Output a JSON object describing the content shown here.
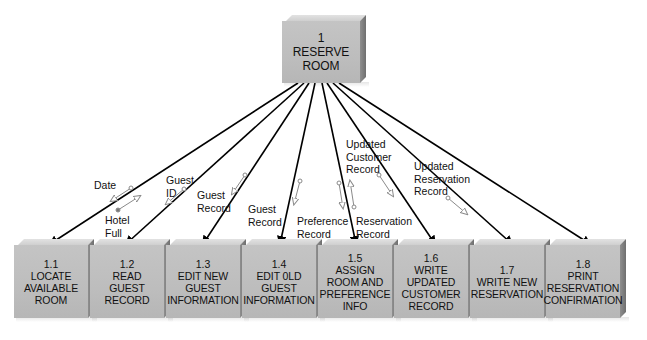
{
  "diagram": {
    "type": "structure chart",
    "root": {
      "id": "1",
      "number": "1",
      "name": "RESERVE\nROOM"
    },
    "children": [
      {
        "id": "1.1",
        "number": "1.1",
        "name": "LOCATE\nAVAILABLE\nROOM"
      },
      {
        "id": "1.2",
        "number": "1.2",
        "name": "READ\nGUEST\nRECORD"
      },
      {
        "id": "1.3",
        "number": "1.3",
        "name": "EDIT NEW\nGUEST\nINFORMATION"
      },
      {
        "id": "1.4",
        "number": "1.4",
        "name": "EDIT 0LD\nGUEST\nINFORMATION"
      },
      {
        "id": "1.5",
        "number": "1.5",
        "name": "ASSIGN\nROOM AND\nPREFERENCE\nINFO"
      },
      {
        "id": "1.6",
        "number": "1.6",
        "name": "WRITE\nUPDATED\nCUSTOMER\nRECORD"
      },
      {
        "id": "1.7",
        "number": "1.7",
        "name": "WRITE NEW\nRESERVATION"
      },
      {
        "id": "1.8",
        "number": "1.8",
        "name": "PRINT\nRESERVATION\nCONFIRMATION"
      }
    ],
    "couples": [
      {
        "label": "Date",
        "to": "1.1",
        "direction": "down",
        "kind": "data"
      },
      {
        "label": "Hotel\nFull",
        "to": "1.1",
        "direction": "up",
        "kind": "control"
      },
      {
        "label": "Guest\nID",
        "to": "1.2",
        "direction": "down",
        "kind": "data"
      },
      {
        "label": "Guest\nRecord",
        "to": "1.3",
        "direction": "down",
        "kind": "data"
      },
      {
        "label": "Guest\nRecord",
        "to": "1.4",
        "direction": "down",
        "kind": "data"
      },
      {
        "label": "Preference\nRecord",
        "to": "1.5",
        "direction": "down",
        "kind": "data"
      },
      {
        "label": "Reservation\nRecord",
        "to": "1.5",
        "direction": "up",
        "kind": "data"
      },
      {
        "label": "Updated\nCustomer\nRecord",
        "to": "1.6",
        "direction": "down",
        "kind": "data"
      },
      {
        "label": "Updated\nReservation\nRecord",
        "to": "1.7",
        "direction": "down",
        "kind": "data"
      }
    ],
    "colors": {
      "box_face": "#bdbdbd",
      "box_top": "#dcdcdc",
      "box_side": "#7a7a7a",
      "line": "#000000",
      "couple": "#8a8a8a"
    }
  }
}
